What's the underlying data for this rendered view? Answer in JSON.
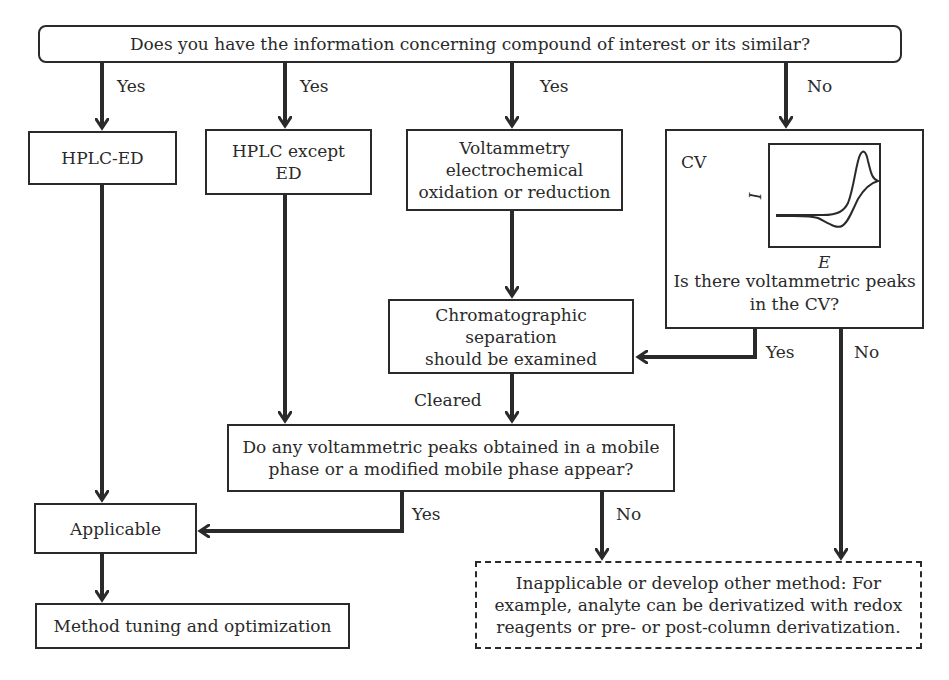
{
  "question_top": "Does you have the information concerning compound of interest or its similar?",
  "branches": {
    "b1_label": "Yes",
    "b2_label": "Yes",
    "b3_label": "Yes",
    "b4_label": "No"
  },
  "boxes": {
    "hplc_ed": "HPLC-ED",
    "hplc_except_line1": "HPLC except",
    "hplc_except_line2": "ED",
    "voltammetry_line1": "Voltammetry",
    "voltammetry_line2": "electrochemical",
    "voltammetry_line3": "oxidation or reduction",
    "chromato_line1": "Chromatographic separation",
    "chromato_line2": "should be examined",
    "peaks_q_line1": "Do any voltammetric peaks obtained in a mobile",
    "peaks_q_line2": "phase or a modified mobile phase appear?",
    "applicable": "Applicable",
    "method_tuning": "Method tuning and optimization",
    "inapplicable_line1": "Inapplicable or develop other method: For",
    "inapplicable_line2": "example, analyte can be derivatized with redox",
    "inapplicable_line3": "reagents or pre- or post-column derivatization."
  },
  "cv_box": {
    "title": "CV",
    "y_axis": "I",
    "x_axis": "E",
    "question_line1": "Is there voltammetric peaks",
    "question_line2": "in the CV?"
  },
  "edge_labels": {
    "cv_yes": "Yes",
    "cv_no": "No",
    "cleared": "Cleared",
    "peaks_yes": "Yes",
    "peaks_no": "No"
  }
}
